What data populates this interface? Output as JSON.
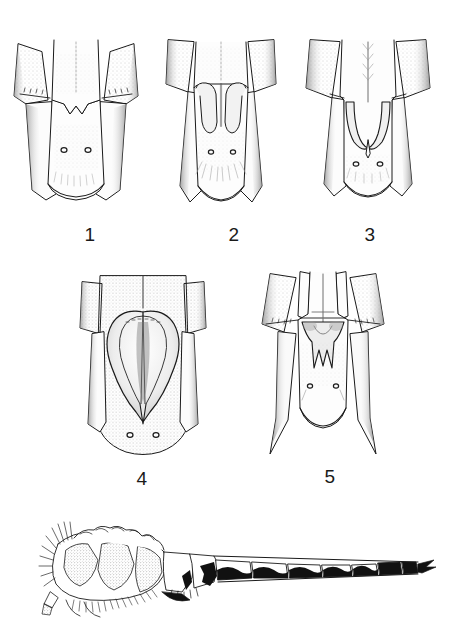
{
  "plate": {
    "title": "Terminal abdominal segments of dragonflies, dorsal view, with lateral habitus",
    "background_color": "#ffffff",
    "ink_color": "#1a1a1a",
    "shading_color": "#8c8c8c",
    "width": 449,
    "height": 626
  },
  "figures": [
    {
      "label": "1",
      "caption": "Figure 1",
      "view": "dorsal",
      "subject": "terminal abdominal segment with shallow V-shaped median notch",
      "structure_note": "broad plate, paired setal pits, lateral lobes diverging outward",
      "row": 1,
      "column": 1
    },
    {
      "label": "2",
      "caption": "Figure 2",
      "view": "dorsal",
      "subject": "terminal abdominal segment with bifid median process",
      "structure_note": "two descending rounded lobes, paired setal pits below, dense ventral setae",
      "row": 1,
      "column": 2
    },
    {
      "label": "3",
      "caption": "Figure 3",
      "view": "dorsal",
      "subject": "terminal abdominal segment with paired incurved sickle-shaped hooks",
      "structure_note": "hooks curving inward to meet medially, median longitudinal carina above",
      "row": 1,
      "column": 3
    },
    {
      "label": "4",
      "caption": "Figure 4",
      "view": "dorsal",
      "subject": "terminal abdominal segment with large cordate median plate",
      "structure_note": "broad heart-shaped shield tapering to an acute apex, finely punctate surface",
      "row": 2,
      "column": 1
    },
    {
      "label": "5",
      "caption": "Figure 5",
      "view": "dorsal",
      "subject": "terminal abdominal segment with trident-shaped median process",
      "structure_note": "W-shaped notched process, lateral appendages with fine spination",
      "row": 2,
      "column": 2
    },
    {
      "label": "",
      "caption": "Lateral habitus",
      "view": "lateral",
      "subject": "thorax and abdomen in lateral view",
      "structure_note": "stippled thorax with setae, elongate abdomen with alternating black and pale segmental markings, terminal appendages black",
      "row": 3,
      "column": 1
    }
  ],
  "habitus": {
    "segment_count": 8,
    "marking_pattern": "alternating black and pale bands",
    "thorax_texture": "stippled"
  }
}
